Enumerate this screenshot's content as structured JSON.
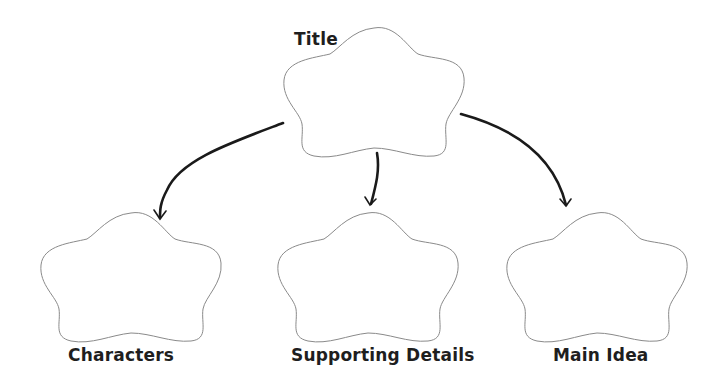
{
  "diagram": {
    "type": "graphic-organizer",
    "nodes": [
      {
        "id": "title",
        "label": "Title"
      },
      {
        "id": "characters",
        "label": "Characters"
      },
      {
        "id": "supporting",
        "label": "Supporting Details"
      },
      {
        "id": "main",
        "label": "Main Idea"
      }
    ],
    "edges": [
      {
        "from": "title",
        "to": "characters"
      },
      {
        "from": "title",
        "to": "supporting"
      },
      {
        "from": "title",
        "to": "main"
      }
    ],
    "colors": {
      "blob_stroke": "#8a8a8a",
      "arrow": "#1a1a1a",
      "text": "#1e1e1e",
      "background": "#ffffff"
    }
  }
}
